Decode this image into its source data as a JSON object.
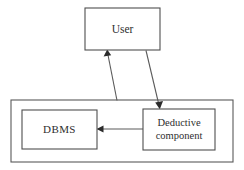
{
  "diagram": {
    "background_color": "#ffffff",
    "stroke_color": "#5a5a5a",
    "text_color": "#2e2e2e",
    "nodes": [
      {
        "id": "user",
        "label": "User",
        "shape": "rectangle",
        "x": 85,
        "y": 8,
        "width": 75,
        "height": 42
      },
      {
        "id": "dbms",
        "label": "DBMS",
        "shape": "rectangle",
        "x": 22,
        "y": 110,
        "width": 75,
        "height": 39
      },
      {
        "id": "deductive-component",
        "label_line1": "Deductive",
        "label_line2": "component",
        "label": "Deductive component",
        "shape": "rectangle",
        "x": 143,
        "y": 109,
        "width": 72,
        "height": 41
      }
    ],
    "containers": [
      {
        "id": "system-container",
        "label": "",
        "shape": "rectangle",
        "x": 11,
        "y": 100,
        "width": 222,
        "height": 62
      }
    ],
    "edges": [
      {
        "id": "dbms-to-user",
        "from": "system-container",
        "to": "user",
        "direction": "up",
        "arrowhead": "target",
        "label": ""
      },
      {
        "id": "user-to-deductive",
        "from": "user",
        "to": "deductive-component",
        "direction": "down",
        "arrowhead": "target",
        "label": ""
      },
      {
        "id": "deductive-to-dbms",
        "from": "deductive-component",
        "to": "dbms",
        "direction": "left",
        "arrowhead": "target",
        "label": ""
      }
    ]
  }
}
